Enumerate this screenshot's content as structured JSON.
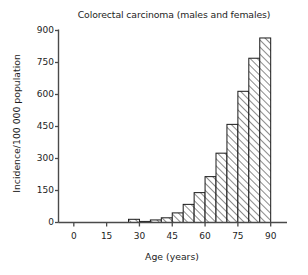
{
  "chart_data": {
    "type": "bar",
    "title": "Colorectal carcinoma (males and females)",
    "xlabel": "Age (years)",
    "ylabel": "Incidence/100 000 population",
    "categories": [
      "25-30",
      "30-35",
      "35-40",
      "40-45",
      "45-50",
      "50-55",
      "55-60",
      "60-65",
      "65-70",
      "70-75",
      "75-80",
      "80-85",
      "85-90"
    ],
    "bin_starts": [
      25,
      30,
      35,
      40,
      45,
      50,
      55,
      60,
      65,
      70,
      75,
      80,
      85
    ],
    "bin_ends": [
      30,
      35,
      40,
      45,
      50,
      55,
      60,
      65,
      70,
      75,
      80,
      85,
      90
    ],
    "values": [
      15,
      5,
      12,
      22,
      45,
      85,
      140,
      215,
      325,
      460,
      615,
      770,
      865
    ],
    "xlim": [
      -7,
      97
    ],
    "ylim": [
      0,
      900
    ],
    "xticks": [
      0,
      15,
      30,
      45,
      60,
      75,
      90
    ],
    "xtick_labels": [
      "0",
      "15",
      "30",
      "45",
      "60",
      "75",
      "90"
    ],
    "yticks": [
      0,
      150,
      300,
      450,
      600,
      750,
      900
    ],
    "ytick_labels": [
      "0",
      "150",
      "300",
      "450",
      "600",
      "750",
      "900"
    ],
    "grid": false,
    "legend": null,
    "bar_fill": "#ffffff",
    "bar_hatch": "diagonal-45",
    "bar_edge_color": "#1a1a1a",
    "axis_color": "#4a4a4a"
  }
}
